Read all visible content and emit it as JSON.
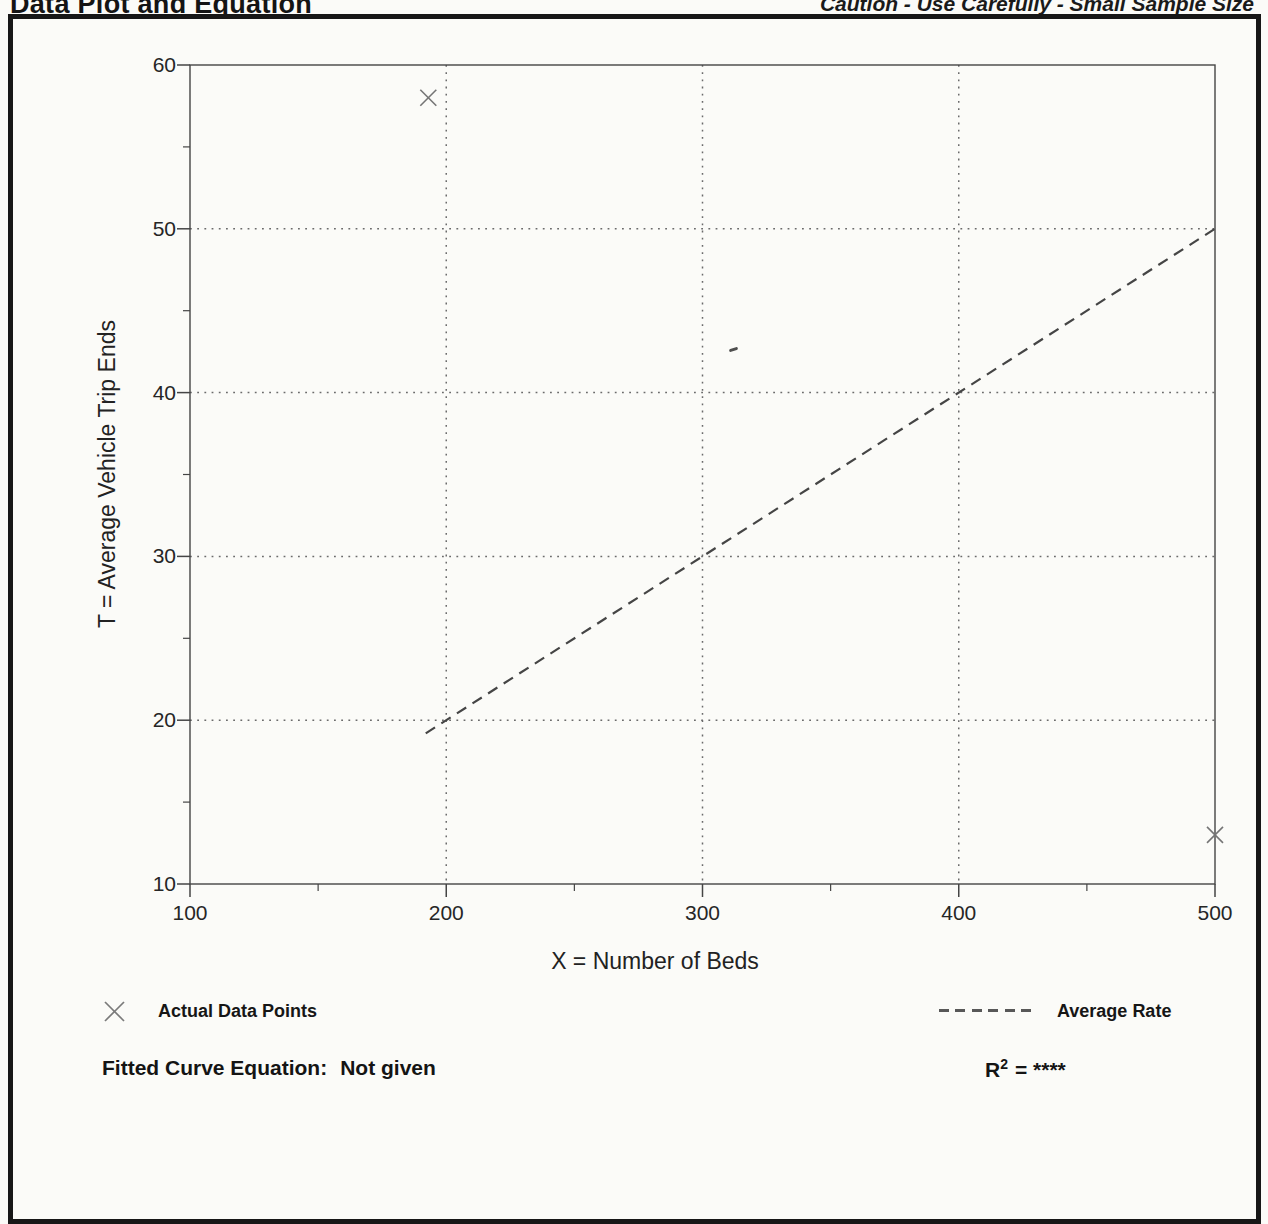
{
  "page": {
    "title": "Data Plot and Equation",
    "caution": "Caution - Use Carefully - Small Sample Size"
  },
  "chart_data": {
    "type": "scatter",
    "title": "Data Plot and Equation",
    "xlabel": "X = Number of Beds",
    "ylabel": "T = Average Vehicle Trip Ends",
    "xlim": [
      100,
      500
    ],
    "ylim": [
      10,
      60
    ],
    "x_ticks_major": [
      100,
      200,
      300,
      400,
      500
    ],
    "x_ticks_minor": [
      150,
      250,
      350,
      450
    ],
    "y_ticks_major": [
      10,
      20,
      30,
      40,
      50,
      60
    ],
    "y_ticks_minor": [
      15,
      25,
      35,
      45,
      55
    ],
    "x_gridlines": [
      200,
      300,
      400
    ],
    "y_gridlines": [
      20,
      30,
      40,
      50
    ],
    "grid_style": "dotted",
    "legend_position": "below-plot",
    "series": [
      {
        "name": "Actual Data Points",
        "type": "scatter",
        "marker": "x",
        "points": [
          [
            193,
            58
          ],
          [
            500,
            13
          ]
        ]
      },
      {
        "name": "Average Rate",
        "type": "line",
        "style": "dashed",
        "slope_trips_per_bed": 0.1,
        "points": [
          [
            192,
            19.2
          ],
          [
            500,
            50
          ]
        ]
      }
    ],
    "legend": [
      {
        "label": "Actual Data Points",
        "symbol": "x-marker"
      },
      {
        "label": "Average Rate",
        "symbol": "dashed-line"
      }
    ]
  },
  "footer": {
    "equation_label": "Fitted Curve Equation:",
    "equation_value": "Not given",
    "r2_base": "R",
    "r2_sup": "2",
    "r2_rest": "= ****"
  },
  "colors": {
    "paper": "#fbfbf8",
    "ink": "#141414",
    "frame": "#171717",
    "chart_line": "#454545",
    "grid_dot": "#6b6b6b",
    "marker": "#757575"
  }
}
